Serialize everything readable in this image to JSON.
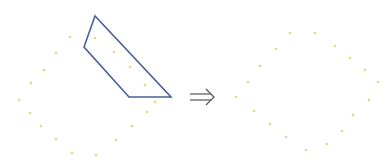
{
  "diagram": {
    "colors": {
      "dot": "#e8d87a",
      "polygon": "#4a5f9a",
      "arrow": "#555555"
    },
    "left": {
      "dots": [
        [
          70,
          37
        ],
        [
          56,
          53
        ],
        [
          44,
          70
        ],
        [
          31,
          83
        ],
        [
          19,
          100
        ],
        [
          30,
          113
        ],
        [
          41,
          126
        ],
        [
          56,
          139
        ],
        [
          72,
          153
        ],
        [
          96,
          155
        ],
        [
          116,
          140
        ],
        [
          132,
          126
        ],
        [
          147,
          112
        ],
        [
          155,
          102
        ],
        [
          145,
          85
        ],
        [
          130,
          67
        ],
        [
          114,
          52
        ],
        [
          95,
          38
        ]
      ],
      "polygon": [
        [
          95,
          16
        ],
        [
          84,
          47
        ],
        [
          129,
          97
        ],
        [
          171,
          97
        ]
      ]
    },
    "arrow": {
      "symbol": "⇒",
      "x1": 190,
      "x2": 214,
      "y": 97
    },
    "right": {
      "dots": [
        [
          290,
          33
        ],
        [
          315,
          33
        ],
        [
          335,
          46
        ],
        [
          350,
          58
        ],
        [
          365,
          70
        ],
        [
          378,
          82
        ],
        [
          369,
          100
        ],
        [
          353,
          115
        ],
        [
          342,
          131
        ],
        [
          327,
          144
        ],
        [
          306,
          150
        ],
        [
          286,
          137
        ],
        [
          270,
          124
        ],
        [
          254,
          111
        ],
        [
          236,
          97
        ],
        [
          248,
          82
        ],
        [
          260,
          66
        ],
        [
          276,
          49
        ]
      ]
    }
  }
}
